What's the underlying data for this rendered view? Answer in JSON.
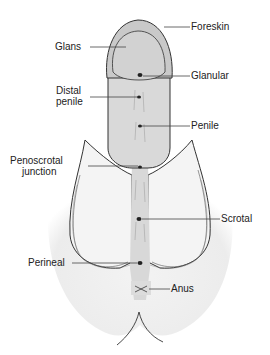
{
  "diagram": {
    "labels": {
      "foreskin": "Foreskin",
      "glans": "Glans",
      "glanular": "Glanular",
      "distal_penile_1": "Distal",
      "distal_penile_2": "penile",
      "penile": "Penile",
      "penoscrotal_1": "Penoscrotal",
      "penoscrotal_2": "junction",
      "scrotal": "Scrotal",
      "perineal": "Perineal",
      "anus": "Anus"
    },
    "colors": {
      "background": "#ffffff",
      "skin_fill": "#e9e9e9",
      "shaft_fill": "#d6d6d6",
      "glans_fill": "#cfcfcf",
      "outline": "#333333",
      "leader_line": "#444444"
    }
  }
}
